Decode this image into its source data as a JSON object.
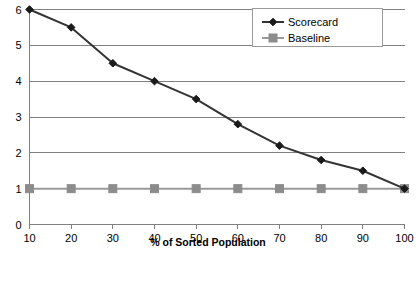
{
  "chart_data": {
    "type": "line",
    "title": "",
    "xlabel": "% of Sorted Population",
    "ylabel": "",
    "x": [
      10,
      20,
      30,
      40,
      50,
      60,
      70,
      80,
      90,
      100
    ],
    "xtick_labels": [
      "10",
      "20",
      "30",
      "40",
      "50",
      "60",
      "70",
      "80",
      "90",
      "100"
    ],
    "ytick_labels": [
      "0",
      "1",
      "2",
      "3",
      "4",
      "5",
      "6"
    ],
    "yticks": [
      0,
      1,
      2,
      3,
      4,
      5,
      6
    ],
    "xlim": [
      10,
      100
    ],
    "ylim": [
      0,
      6
    ],
    "grid": "horizontal",
    "legend_position": "top-right",
    "series": [
      {
        "name": "Scorecard",
        "values": [
          6,
          5.5,
          4.5,
          4,
          3.5,
          2.8,
          2.2,
          1.8,
          1.5,
          1
        ],
        "color": "#333333",
        "marker": "diamond",
        "marker_color": "#1a1a1a"
      },
      {
        "name": "Baseline",
        "values": [
          1,
          1,
          1,
          1,
          1,
          1,
          1,
          1,
          1,
          1
        ],
        "color": "#9a9a9a",
        "marker": "square",
        "marker_color": "#8c8c8c"
      }
    ]
  },
  "legend": {
    "items": [
      {
        "label": "Scorecard"
      },
      {
        "label": "Baseline"
      }
    ]
  },
  "axes": {
    "x_title": "% of Sorted Population"
  },
  "colors": {
    "scorecard": "#333333",
    "baseline": "#9a9a9a",
    "grid": "#808080",
    "background": "#ffffff"
  }
}
